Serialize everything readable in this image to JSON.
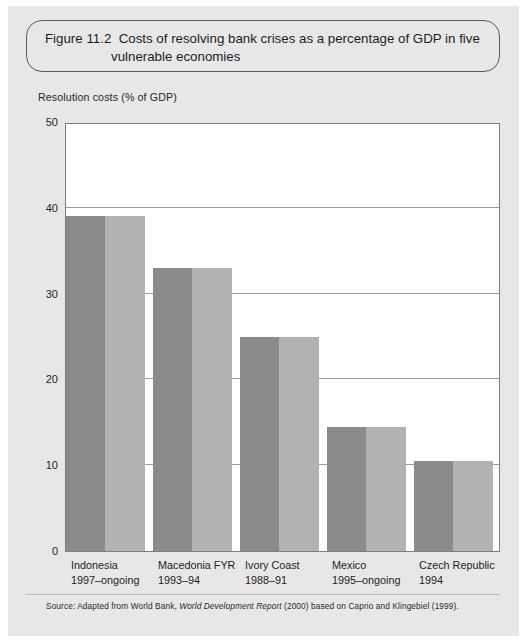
{
  "figure": {
    "label": "Figure 11.2",
    "caption_line1": "Costs of resolving bank crises as a percentage of GDP in five",
    "caption_line2": "vulnerable economies"
  },
  "source": {
    "prefix": "Source: Adapted from World Bank, ",
    "italic": "World Development Report",
    "suffix": " (2000) based on Caprio and Klingebiel (1999)."
  },
  "colors": {
    "bar_dark": "#8b8b8b",
    "bar_light": "#b2b2b2",
    "panel_background": "#e7e7e7",
    "plot_background": "#ffffff",
    "gridline": "#9a9a9a"
  },
  "chart_data": {
    "type": "bar",
    "xlabel": "",
    "ylabel": "Resolution costs (% of GDP)",
    "ylim": [
      0,
      50
    ],
    "yticks": [
      0,
      10,
      20,
      30,
      40,
      50
    ],
    "ytick_labels": [
      "0",
      "10",
      "20",
      "30",
      "40",
      "50"
    ],
    "grid": true,
    "legend": "none",
    "categories": [
      "Indonesia",
      "Macedonia FYR",
      "Ivory Coast",
      "Mexico",
      "Czech Republic"
    ],
    "category_periods": [
      "1997–ongoing",
      "1993–94",
      "1988–91",
      "1995–ongoing",
      "1994"
    ],
    "values": [
      39,
      33,
      25,
      14.5,
      10.5
    ]
  }
}
